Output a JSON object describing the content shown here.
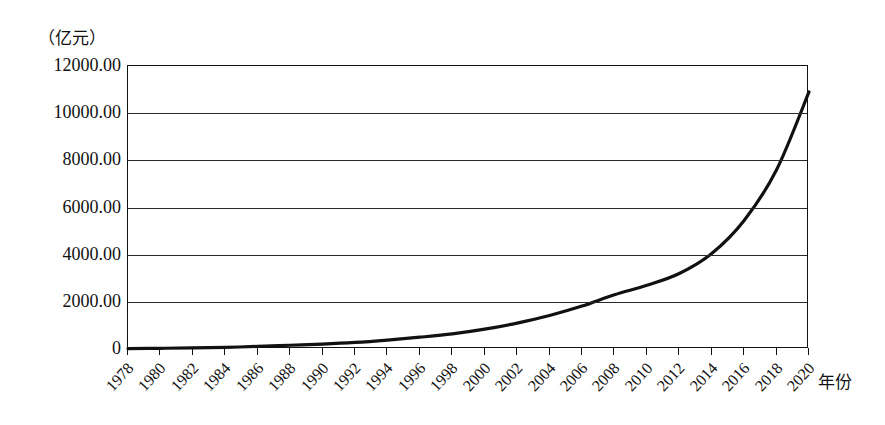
{
  "chart_data": {
    "type": "line",
    "title": "",
    "unit_label": "（亿元）",
    "xlabel": "年份",
    "ylabel": "",
    "xlim": [
      1978,
      2020
    ],
    "ylim": [
      0,
      12000
    ],
    "grid": true,
    "legend": "none",
    "y_ticks": [
      "0",
      "2000.00",
      "4000.00",
      "6000.00",
      "8000.00",
      "10000.00",
      "12000.00"
    ],
    "y_tick_values": [
      0,
      2000,
      4000,
      6000,
      8000,
      10000,
      12000
    ],
    "x_tick_labels": [
      "1978",
      "1980",
      "1982",
      "1984",
      "1986",
      "1988",
      "1990",
      "1992",
      "1994",
      "1996",
      "1998",
      "2000",
      "2002",
      "2004",
      "2006",
      "2008",
      "2010",
      "2012",
      "2014",
      "2016",
      "2018",
      "2020"
    ],
    "categories": [
      1978,
      1980,
      1982,
      1984,
      1986,
      1988,
      1990,
      1992,
      1994,
      1996,
      1998,
      2000,
      2002,
      2004,
      2006,
      2008,
      2010,
      2012,
      2014,
      2016,
      2018,
      2020
    ],
    "series": [
      {
        "name": "",
        "color": "#111111",
        "values": [
          20,
          30,
          45,
          70,
          110,
          160,
          210,
          280,
          380,
          500,
          640,
          840,
          1100,
          1420,
          1820,
          2300,
          2700,
          3200,
          4050,
          5450,
          7600,
          10900
        ]
      }
    ]
  }
}
